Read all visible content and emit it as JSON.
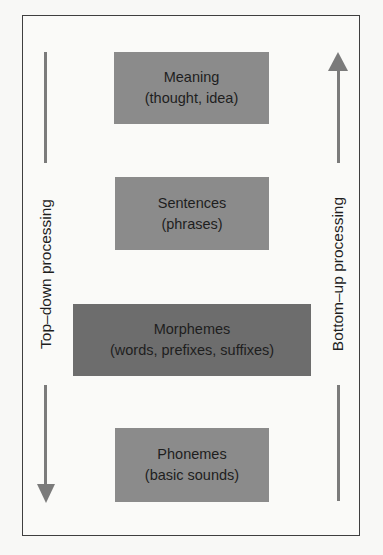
{
  "diagram": {
    "title": "",
    "levels": [
      {
        "title": "Meaning",
        "subtitle": "(thought, idea)"
      },
      {
        "title": "Sentences",
        "subtitle": "(phrases)"
      },
      {
        "title": "Morphemes",
        "subtitle": "(words, prefixes, suffixes)"
      },
      {
        "title": "Phonemes",
        "subtitle": "(basic sounds)"
      }
    ],
    "left_arrow": {
      "label": "Top–down processing",
      "direction": "down"
    },
    "right_arrow": {
      "label": "Bottom–up processing",
      "direction": "up"
    },
    "colors": {
      "frame_border": "#3f3f3f",
      "box_light": "#8b8b8b",
      "box_dark": "#6d6d6d",
      "arrow": "#7b7b7b",
      "text": "#1e1e1e"
    }
  }
}
